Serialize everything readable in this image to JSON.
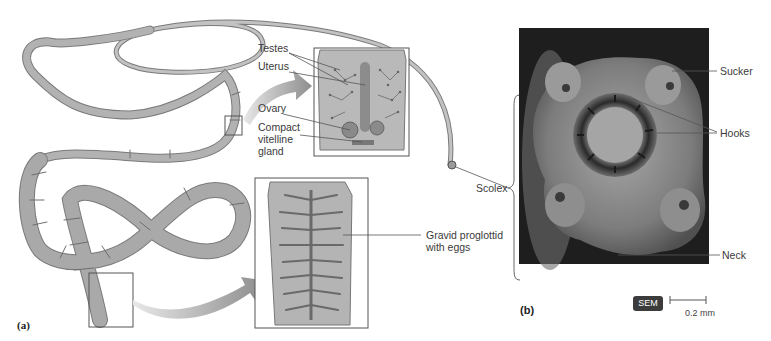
{
  "figure": {
    "panel_a": {
      "label": "(a)",
      "callouts": {
        "testes": "Testes",
        "uterus": "Uterus",
        "ovary": "Ovary",
        "vitelline": "Compact\nvitelline\ngland",
        "gravid": "Gravid proglottid\nwith eggs",
        "scolex": "Scolex"
      }
    },
    "panel_b": {
      "label": "(b)",
      "callouts": {
        "sucker": "Sucker",
        "hooks": "Hooks",
        "neck": "Neck"
      },
      "badge": "SEM",
      "scale_bar": "0.2 mm"
    },
    "colors": {
      "worm_fill": "#a9a9a9",
      "worm_stroke": "#6e6e6e",
      "proglottid_fill": "#b4b4b4",
      "branch": "#6a6a6a",
      "photo_bg": "#1e1e1e",
      "photo_tissue": "#8a8a8a"
    }
  }
}
